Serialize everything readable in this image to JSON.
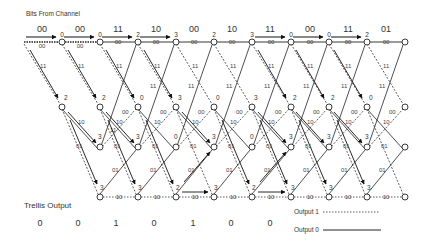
{
  "title": "Bits From Channel",
  "received_bits": [
    "00",
    "00",
    "11",
    "10",
    "00",
    "10",
    "11",
    "00",
    "11",
    "01"
  ],
  "trellis_output_label": "Trellis Output",
  "trellis_output": [
    "0",
    "0",
    "1",
    "0",
    "1",
    "0",
    "0"
  ],
  "legend": {
    "output1": "Output 1",
    "output0": "Output 0"
  },
  "states": [
    {
      "row": 0,
      "edge_label": "00",
      "metrics": [
        "0",
        "0",
        "2",
        "3",
        "2",
        "3",
        "0",
        "0",
        "2"
      ]
    },
    {
      "row": 1,
      "edge_labels": [
        "11",
        "00"
      ],
      "metrics": [
        "2",
        "2",
        "0",
        "3",
        "0",
        "3",
        "2",
        "2",
        "0"
      ]
    },
    {
      "row": 2,
      "edge_labels": [
        "10",
        "01"
      ],
      "metrics": [
        "3",
        "3",
        "0",
        "3",
        "0",
        "3",
        "3",
        "3"
      ]
    },
    {
      "row": 3,
      "edge_label": "10",
      "metrics": [
        "3",
        "3",
        "2",
        "3",
        "2",
        "3",
        "3",
        "3"
      ]
    }
  ],
  "edge_labels": {
    "e00": "00",
    "e11": "11",
    "e10": "10",
    "e01": "01"
  },
  "colors": {
    "line": "#222222",
    "background": "#ffffff"
  }
}
